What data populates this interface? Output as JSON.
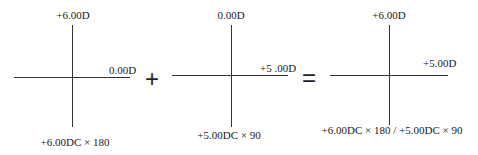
{
  "diagram": {
    "crosses": [
      {
        "top": "+6.00D",
        "right": "0.00D",
        "bottom": "+6.00DC × 180"
      },
      {
        "top": "0.00D",
        "right": "+5 .00D",
        "bottom": "+5.00DC × 90"
      },
      {
        "top": "+6.00D",
        "right": "+5.00D",
        "bottom": "+6.00DC × 180 / +5.00DC × 90"
      }
    ],
    "operators": [
      "+",
      "="
    ]
  }
}
